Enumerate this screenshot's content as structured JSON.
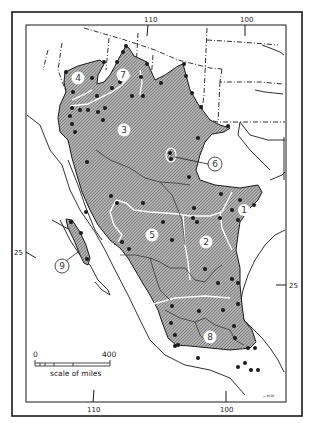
{
  "map": {
    "type": "distribution map",
    "region": "Mexico and southwestern United States",
    "colors": {
      "range_fill": "#9a9a9a",
      "border": "#1a1a1a",
      "background": "#ffffff",
      "dot": "#1a1a1a"
    },
    "longitude_labels_top": [
      {
        "label": "110",
        "x": 150
      },
      {
        "label": "100",
        "x": 247
      }
    ],
    "longitude_labels_bottom": [
      {
        "label": "110",
        "x": 93
      },
      {
        "label": "100",
        "x": 226
      }
    ],
    "latitude_labels": [
      {
        "label": "25",
        "side": "left",
        "y": 252
      },
      {
        "label": "25",
        "side": "right",
        "y": 286
      }
    ],
    "regions": [
      {
        "id": "1",
        "label": "1",
        "circled": true,
        "filled_label": true
      },
      {
        "id": "2",
        "label": "2",
        "circled": true,
        "filled_label": true
      },
      {
        "id": "3",
        "label": "3",
        "circled": true,
        "filled_label": true
      },
      {
        "id": "4",
        "label": "4",
        "circled": true,
        "filled_label": true
      },
      {
        "id": "5",
        "label": "5",
        "circled": true,
        "filled_label": true
      },
      {
        "id": "6",
        "label": "6",
        "circled": true,
        "filled_label": false
      },
      {
        "id": "7",
        "label": "7",
        "circled": true,
        "filled_label": true
      },
      {
        "id": "8",
        "label": "8",
        "circled": true,
        "filled_label": true
      },
      {
        "id": "9",
        "label": "9",
        "circled": true,
        "filled_label": false
      }
    ],
    "scale": {
      "start": "0",
      "end": "400",
      "caption": "scale of miles"
    },
    "signature": "ᴗ.ᴍ.ᴍ"
  }
}
